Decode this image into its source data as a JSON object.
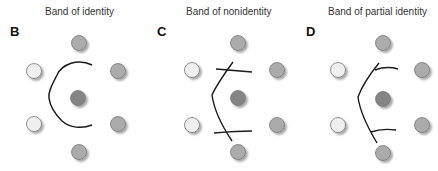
{
  "panels": [
    {
      "label": "B",
      "title": "Band of identity",
      "title_x": 45,
      "label_x": 10,
      "type": "identity",
      "wells": {
        "top": {
          "x": 79,
          "y": 43,
          "shade": "medium"
        },
        "left_top": {
          "x": 34,
          "y": 71,
          "shade": "light"
        },
        "right_top": {
          "x": 118,
          "y": 71,
          "shade": "medium"
        },
        "center": {
          "x": 78,
          "y": 98,
          "shade": "dark"
        },
        "left_bottom": {
          "x": 34,
          "y": 124,
          "shade": "light"
        },
        "right_bottom": {
          "x": 118,
          "y": 124,
          "shade": "medium"
        },
        "bottom": {
          "x": 79,
          "y": 152,
          "shade": "medium"
        }
      }
    },
    {
      "label": "C",
      "title": "Band of nonidentity",
      "title_x": 186,
      "label_x": 157,
      "type": "nonidentity",
      "wells": {
        "top": {
          "x": 238,
          "y": 43,
          "shade": "medium"
        },
        "left_top": {
          "x": 192,
          "y": 70,
          "shade": "light"
        },
        "right_top": {
          "x": 277,
          "y": 70,
          "shade": "medium"
        },
        "center": {
          "x": 238,
          "y": 98,
          "shade": "dark"
        },
        "left_bottom": {
          "x": 192,
          "y": 125,
          "shade": "light"
        },
        "right_bottom": {
          "x": 277,
          "y": 125,
          "shade": "medium"
        },
        "bottom": {
          "x": 238,
          "y": 152,
          "shade": "medium"
        }
      }
    },
    {
      "label": "D",
      "title": "Band of partial identity",
      "title_x": 328,
      "label_x": 306,
      "type": "partial identity",
      "wells": {
        "top": {
          "x": 383,
          "y": 43,
          "shade": "medium"
        },
        "left_top": {
          "x": 338,
          "y": 70,
          "shade": "light"
        },
        "right_top": {
          "x": 422,
          "y": 70,
          "shade": "medium"
        },
        "center": {
          "x": 383,
          "y": 99,
          "shade": "dark"
        },
        "left_bottom": {
          "x": 338,
          "y": 125,
          "shade": "light"
        },
        "right_bottom": {
          "x": 422,
          "y": 125,
          "shade": "medium"
        },
        "bottom": {
          "x": 383,
          "y": 153,
          "shade": "medium"
        }
      }
    }
  ],
  "colors": {
    "light": "#efefef",
    "medium": "#ababab",
    "dark": "#858585",
    "stroke": "#777777",
    "line": "#1a1a1a"
  }
}
